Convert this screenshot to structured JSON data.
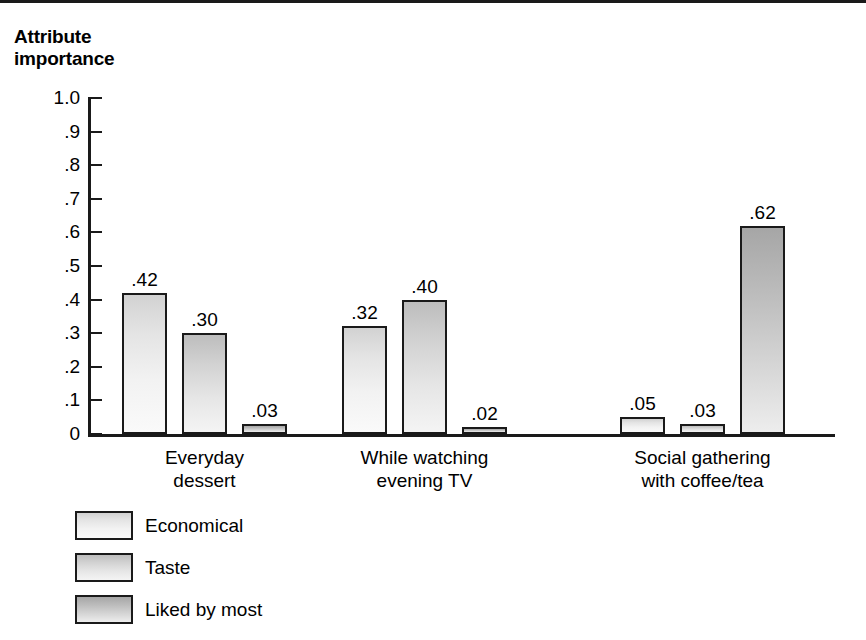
{
  "figure": {
    "title": "Attribute\nimportance"
  },
  "chart_data": {
    "type": "bar",
    "title": "Attribute importance",
    "xlabel": "",
    "ylabel": "Attribute importance",
    "ylim": [
      0,
      1.0
    ],
    "grid": false,
    "legend_position": "bottom-left",
    "categories": [
      "Everyday\ndessert",
      "While watching\nevening TV",
      "Social gathering\nwith coffee/tea"
    ],
    "y_ticks": [
      {
        "value": 1.0,
        "label": "1.0"
      },
      {
        "value": 0.9,
        "label": ".9"
      },
      {
        "value": 0.8,
        "label": ".8"
      },
      {
        "value": 0.7,
        "label": ".7"
      },
      {
        "value": 0.6,
        "label": ".6"
      },
      {
        "value": 0.5,
        "label": ".5"
      },
      {
        "value": 0.4,
        "label": ".4"
      },
      {
        "value": 0.3,
        "label": ".3"
      },
      {
        "value": 0.2,
        "label": ".2"
      },
      {
        "value": 0.1,
        "label": ".1"
      },
      {
        "value": 0.0,
        "label": "0"
      }
    ],
    "series": [
      {
        "name": "Economical",
        "values": [
          0.42,
          0.32,
          0.05
        ],
        "labels": [
          ".42",
          ".32",
          ".05"
        ]
      },
      {
        "name": "Taste",
        "values": [
          0.3,
          0.4,
          0.03
        ],
        "labels": [
          ".30",
          ".40",
          ".03"
        ]
      },
      {
        "name": "Liked by most",
        "values": [
          0.03,
          0.02,
          0.62
        ],
        "labels": [
          ".03",
          ".02",
          ".62"
        ]
      }
    ]
  },
  "legend": {
    "items": [
      {
        "label": "Economical"
      },
      {
        "label": "Taste"
      },
      {
        "label": "Liked by most"
      }
    ]
  }
}
